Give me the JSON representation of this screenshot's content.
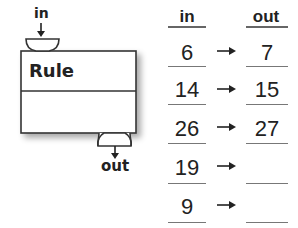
{
  "machine": {
    "input_label": "in",
    "rule_label": "Rule",
    "output_label": "out"
  },
  "table": {
    "headers": {
      "in": "in",
      "out": "out"
    },
    "rows": [
      {
        "in": "6",
        "out": "7"
      },
      {
        "in": "14",
        "out": "15"
      },
      {
        "in": "26",
        "out": "27"
      },
      {
        "in": "19",
        "out": ""
      },
      {
        "in": "9",
        "out": ""
      }
    ],
    "arrow_symbol": "→"
  }
}
